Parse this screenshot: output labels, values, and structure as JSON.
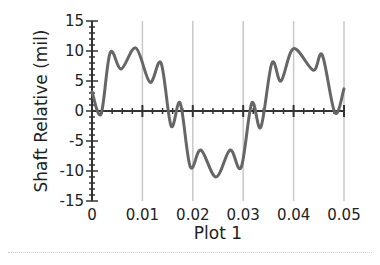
{
  "chart_data": {
    "type": "line",
    "title": "",
    "xlabel": "Plot 1",
    "ylabel": "Shaft Relative (mil)",
    "xlim": [
      0,
      0.05
    ],
    "ylim": [
      -15,
      15
    ],
    "x_ticks": [
      "0",
      "0.01",
      "0.02",
      "0.03",
      "0.04",
      "0.05"
    ],
    "x_tick_values": [
      0,
      0.01,
      0.02,
      0.03,
      0.04,
      0.05
    ],
    "y_ticks": [
      "15",
      "10",
      "5",
      "0",
      "-5",
      "-10",
      "-15"
    ],
    "y_tick_values": [
      15,
      10,
      5,
      0,
      -5,
      -10,
      -15
    ],
    "grid": "vertical",
    "legend": "none",
    "colors": {
      "line": "#666666",
      "grid": "#c8c8c8",
      "axis": "#333333"
    },
    "series": [
      {
        "name": "Shaft Relative",
        "x": [
          0,
          0.0018,
          0.0036,
          0.0058,
          0.0087,
          0.0115,
          0.0137,
          0.0157,
          0.0175,
          0.0195,
          0.0216,
          0.0246,
          0.0274,
          0.0296,
          0.0317,
          0.0335,
          0.0357,
          0.0375,
          0.04,
          0.0439,
          0.0457,
          0.0482,
          0.05
        ],
        "y": [
          3.2,
          -0.5,
          9.7,
          7.0,
          10.5,
          4.8,
          8.0,
          -2.5,
          1.3,
          -9.3,
          -6.5,
          -11.0,
          -6.5,
          -9.4,
          1.3,
          -2.7,
          8.0,
          5.0,
          10.4,
          6.8,
          9.3,
          -0.3,
          3.7
        ]
      }
    ]
  }
}
